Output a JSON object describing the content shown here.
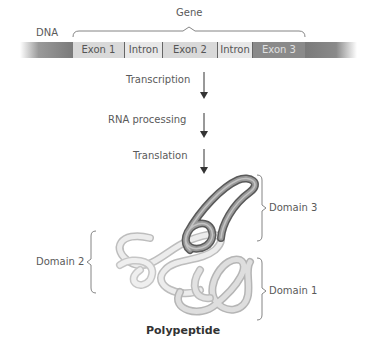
{
  "diagram": {
    "title_label": "Gene",
    "dna_label": "DNA",
    "segments": [
      {
        "label": "Exon 1",
        "type": "exon",
        "color": "#d9d9d9"
      },
      {
        "label": "Intron",
        "type": "intron",
        "color": "#e8e8e8"
      },
      {
        "label": "Exon 2",
        "type": "exon",
        "color": "#d9d9d9"
      },
      {
        "label": "Intron",
        "type": "intron",
        "color": "#e8e8e8"
      },
      {
        "label": "Exon 3",
        "type": "exon",
        "color": "#8a8a8a"
      }
    ],
    "steps": [
      {
        "label": "Transcription"
      },
      {
        "label": "RNA processing"
      },
      {
        "label": "Translation"
      }
    ],
    "domains": [
      {
        "label": "Domain 3",
        "color": "#8c8c8c"
      },
      {
        "label": "Domain 2",
        "color": "#e6e6e6"
      },
      {
        "label": "Domain 1",
        "color": "#d4d4d4"
      }
    ],
    "product_label": "Polypeptide"
  }
}
